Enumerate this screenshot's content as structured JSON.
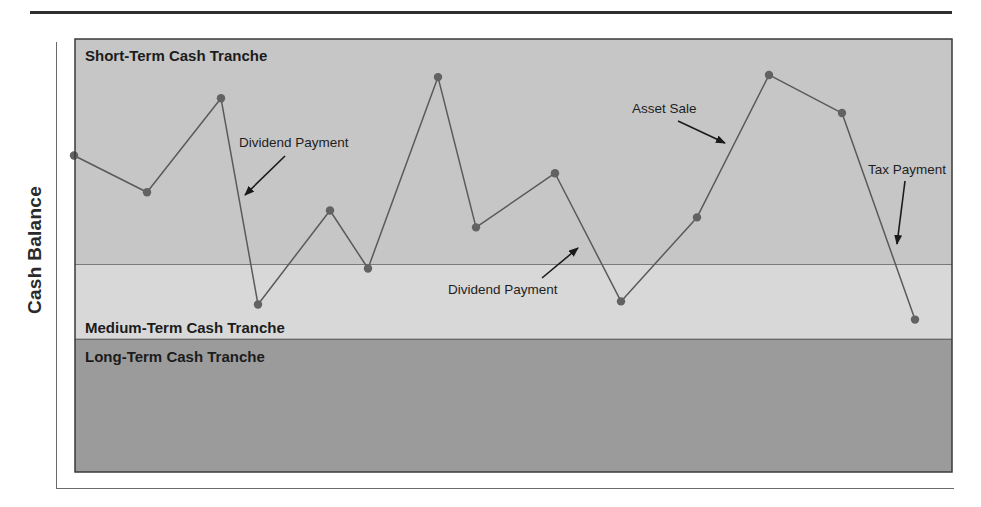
{
  "chart_data": {
    "type": "line",
    "title": "",
    "xlabel": "",
    "ylabel": "Cash Balance",
    "ylim": [
      0,
      100
    ],
    "grid": false,
    "legend": null,
    "x": [
      1,
      2,
      3,
      4,
      5,
      6,
      7,
      8,
      9,
      10,
      11,
      12,
      13,
      14
    ],
    "series": [
      {
        "name": "Cash Balance",
        "values": [
          73.1,
          64.6,
          86.3,
          38.7,
          60.4,
          47.0,
          91.2,
          56.5,
          69.0,
          39.4,
          58.8,
          91.7,
          82.9,
          35.2
        ]
      }
    ],
    "bands": [
      {
        "name": "Short-Term Cash Tranche",
        "from": 47.9,
        "to": 100,
        "color": "#c6c6c6",
        "label_position": "top-left"
      },
      {
        "name": "Medium-Term Cash Tranche",
        "from": 30.6,
        "to": 47.9,
        "color": "#d8d8d8",
        "label_position": "bottom-left"
      },
      {
        "name": "Long-Term Cash Tranche",
        "from": 0,
        "to": 30.6,
        "color": "#9b9b9b",
        "label_position": "top-left"
      }
    ],
    "annotations": [
      {
        "text": "Dividend Payment",
        "text_xy": [
          239,
          147
        ],
        "arrow_from": [
          285,
          156
        ],
        "arrow_to": [
          245,
          195
        ]
      },
      {
        "text": "Dividend Payment",
        "text_xy": [
          448,
          294
        ],
        "arrow_from": [
          542,
          278
        ],
        "arrow_to": [
          578,
          248
        ]
      },
      {
        "text": "Asset Sale",
        "text_xy": [
          632,
          113
        ],
        "arrow_from": [
          678,
          121
        ],
        "arrow_to": [
          725,
          143
        ]
      },
      {
        "text": "Tax Payment",
        "text_xy": [
          868,
          174
        ],
        "arrow_from": [
          905,
          181
        ],
        "arrow_to": [
          897,
          244
        ]
      }
    ],
    "colors": {
      "line": "#5a5a5a",
      "marker": "#626262",
      "border": "#3a3a3a",
      "band_divider": "#3a3a3a",
      "arrow": "#1a1a1a"
    }
  },
  "figure": {
    "ylabel": "Cash Balance"
  }
}
